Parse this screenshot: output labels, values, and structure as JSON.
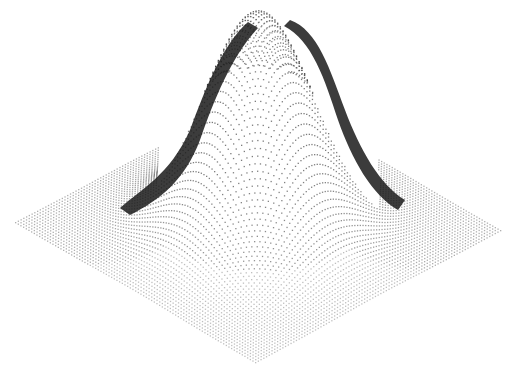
{
  "chart_data": {
    "type": "surface",
    "title": "",
    "xlabel": "",
    "ylabel": "",
    "zlabel": "",
    "function": "z = exp(-(x^2 + y^2) / (2*sigma^2))",
    "x_range": [
      -1,
      1
    ],
    "y_range": [
      -1,
      1
    ],
    "z_range": [
      0,
      1
    ],
    "sigma": 0.32,
    "grid": false,
    "legend": null,
    "peak": {
      "x": 0,
      "y": 0,
      "z": 1
    },
    "render": {
      "style": "dots",
      "dot_color": "#1a1a1a",
      "background": "#ffffff",
      "corners_px": {
        "left": [
          15,
          222
        ],
        "right": [
          500,
          230
        ],
        "bottom": [
          255,
          362
        ],
        "back": [
          262,
          95
        ]
      },
      "peak_px": [
        268,
        12
      ]
    }
  },
  "colors": {
    "background": "#ffffff",
    "ink": "#1a1a1a"
  }
}
